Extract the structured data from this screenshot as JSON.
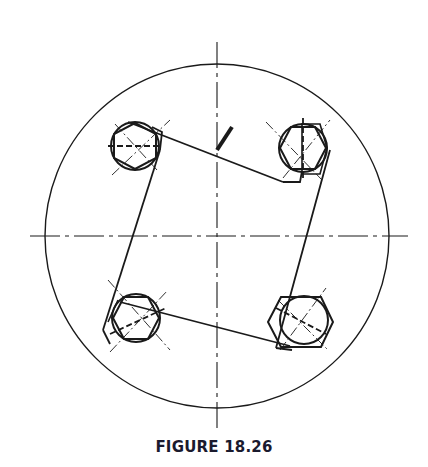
{
  "figure": {
    "caption": "FIGURE 18.26",
    "colors": {
      "line": "#1a1a1a",
      "background": "#ffffff",
      "caption": "#1a1a2e"
    }
  },
  "geometry": {
    "outer_circle": {
      "cx": 217,
      "cy": 236,
      "r": 172
    },
    "centerlines": {
      "vertical": {
        "x": 217,
        "y1": 42,
        "y2": 432
      },
      "horizontal": {
        "y": 236,
        "x1": 30,
        "x2": 408
      }
    },
    "bolts": [
      {
        "name": "top-left",
        "cx": 135,
        "cy": 146,
        "r": 24
      },
      {
        "name": "top-right",
        "cx": 303,
        "cy": 148,
        "r": 24
      },
      {
        "name": "bottom-left",
        "cx": 136,
        "cy": 318,
        "r": 24
      },
      {
        "name": "bottom-right",
        "cx": 304,
        "cy": 320,
        "r": 24
      }
    ]
  }
}
